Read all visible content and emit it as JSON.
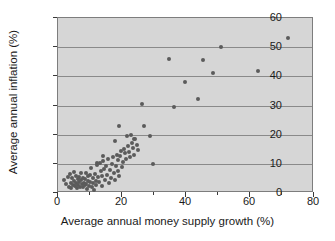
{
  "chart_data": {
    "type": "scatter",
    "title": "",
    "xlabel": "Average annual money supply growth (%)",
    "ylabel": "Average annual inflation (%)",
    "xlim": [
      0,
      80
    ],
    "ylim": [
      0,
      60
    ],
    "xticks": [
      0,
      20,
      40,
      60,
      80
    ],
    "xminorticks": [
      10,
      30,
      50,
      70
    ],
    "yticks": [
      0,
      10,
      20,
      30,
      40,
      50,
      60
    ],
    "grid": "horizontal",
    "legend": "none",
    "plot_background": "#d6d6d6",
    "point_color": "#5b5b5b",
    "gridline_color": "#8a8a8a",
    "points": [
      [
        2.0,
        4.6
      ],
      [
        2.6,
        3.0
      ],
      [
        3.1,
        5.4
      ],
      [
        3.4,
        2.2
      ],
      [
        3.8,
        6.4
      ],
      [
        4.0,
        3.6
      ],
      [
        4.2,
        1.8
      ],
      [
        4.5,
        5.0
      ],
      [
        4.7,
        2.8
      ],
      [
        4.9,
        7.2
      ],
      [
        5.1,
        4.1
      ],
      [
        5.3,
        2.4
      ],
      [
        5.5,
        6.0
      ],
      [
        5.7,
        3.3
      ],
      [
        5.9,
        1.6
      ],
      [
        6.1,
        4.8
      ],
      [
        6.3,
        2.9
      ],
      [
        6.5,
        5.6
      ],
      [
        6.7,
        3.8
      ],
      [
        6.9,
        2.1
      ],
      [
        7.1,
        4.4
      ],
      [
        7.3,
        6.8
      ],
      [
        7.5,
        3.1
      ],
      [
        7.7,
        1.9
      ],
      [
        7.9,
        5.2
      ],
      [
        8.1,
        3.5
      ],
      [
        8.3,
        2.6
      ],
      [
        8.5,
        4.9
      ],
      [
        8.7,
        7.0
      ],
      [
        8.9,
        3.2
      ],
      [
        9.1,
        1.4
      ],
      [
        9.3,
        5.8
      ],
      [
        9.5,
        4.0
      ],
      [
        9.7,
        2.3
      ],
      [
        9.9,
        6.2
      ],
      [
        10.1,
        3.7
      ],
      [
        10.4,
        8.6
      ],
      [
        10.6,
        2.0
      ],
      [
        10.8,
        5.1
      ],
      [
        11.0,
        3.4
      ],
      [
        11.2,
        1.2
      ],
      [
        11.5,
        6.6
      ],
      [
        11.8,
        4.2
      ],
      [
        12.0,
        2.7
      ],
      [
        12.3,
        9.6
      ],
      [
        12.5,
        5.5
      ],
      [
        12.8,
        3.9
      ],
      [
        13.0,
        10.4
      ],
      [
        13.3,
        7.4
      ],
      [
        13.6,
        2.5
      ],
      [
        13.9,
        5.9
      ],
      [
        14.1,
        11.0
      ],
      [
        14.4,
        8.2
      ],
      [
        14.7,
        4.3
      ],
      [
        15.0,
        9.1
      ],
      [
        15.3,
        6.1
      ],
      [
        15.6,
        11.6
      ],
      [
        15.9,
        3.6
      ],
      [
        16.2,
        8.0
      ],
      [
        16.5,
        5.3
      ],
      [
        16.8,
        10.0
      ],
      [
        17.1,
        12.2
      ],
      [
        17.4,
        6.9
      ],
      [
        17.7,
        4.5
      ],
      [
        18.0,
        9.4
      ],
      [
        18.3,
        13.0
      ],
      [
        18.6,
        7.6
      ],
      [
        18.9,
        11.4
      ],
      [
        19.2,
        5.7
      ],
      [
        19.5,
        12.6
      ],
      [
        19.8,
        14.4
      ],
      [
        20.1,
        8.8
      ],
      [
        20.4,
        10.6
      ],
      [
        20.7,
        15.2
      ],
      [
        21.0,
        13.6
      ],
      [
        21.4,
        11.8
      ],
      [
        21.8,
        16.0
      ],
      [
        22.2,
        14.0
      ],
      [
        22.6,
        12.4
      ],
      [
        23.0,
        17.2
      ],
      [
        23.4,
        15.6
      ],
      [
        23.8,
        13.2
      ],
      [
        24.2,
        18.4
      ],
      [
        24.6,
        16.6
      ],
      [
        25.0,
        14.6
      ],
      [
        12.2,
        10.2
      ],
      [
        14.0,
        12.8
      ],
      [
        17.8,
        17.8
      ],
      [
        19.0,
        23.0
      ],
      [
        21.6,
        19.4
      ],
      [
        22.8,
        19.8
      ],
      [
        23.6,
        18.6
      ],
      [
        26.4,
        30.4
      ],
      [
        26.8,
        23.0
      ],
      [
        28.8,
        19.4
      ],
      [
        29.6,
        9.8
      ],
      [
        34.8,
        45.9
      ],
      [
        36.2,
        29.4
      ],
      [
        39.6,
        37.9
      ],
      [
        43.8,
        32.3
      ],
      [
        45.2,
        45.6
      ],
      [
        48.4,
        41.1
      ],
      [
        50.8,
        50.1
      ],
      [
        62.6,
        41.8
      ],
      [
        72.0,
        53.1
      ]
    ]
  }
}
